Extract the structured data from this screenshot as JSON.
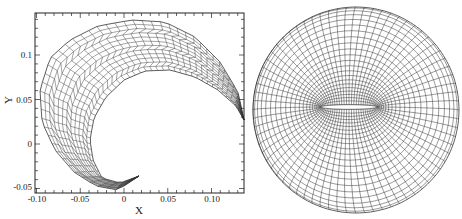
{
  "figures": [
    {
      "id": "left",
      "title": "Curved structured mesh (spiral/crescent band)",
      "xlabel": "X",
      "ylabel": "Y",
      "xlim": [
        -0.105,
        0.14
      ],
      "ylim": [
        -0.055,
        0.148
      ],
      "xticks": [
        {
          "value": -0.1,
          "label": "-0.10"
        },
        {
          "value": -0.05,
          "label": "-0.05"
        },
        {
          "value": 0,
          "label": "0"
        },
        {
          "value": 0.05,
          "label": "0.05"
        },
        {
          "value": 0.1,
          "label": "0.10"
        }
      ],
      "yticks": [
        {
          "value": -0.05,
          "label": "-0.05"
        },
        {
          "value": 0,
          "label": "0"
        },
        {
          "value": 0.05,
          "label": "0.05"
        },
        {
          "value": 0.1,
          "label": "0.1"
        }
      ],
      "mesh": {
        "layers": 12,
        "line_color": "#333333"
      }
    },
    {
      "id": "right",
      "title": "O-type grid around thin airfoil in circular domain",
      "mesh": {
        "radial_lines": 72,
        "rings": 22,
        "line_color": "#333333",
        "airfoil_color": "#ffffff"
      }
    }
  ],
  "labels": {
    "xlabel": "X",
    "ylabel": "Y",
    "xt0": "-0.10",
    "xt1": "-0.05",
    "xt2": "0",
    "xt3": "0.05",
    "xt4": "0.10",
    "yt0": "0.1",
    "yt1": "0.05",
    "yt2": "0",
    "yt3": "-0.05"
  }
}
